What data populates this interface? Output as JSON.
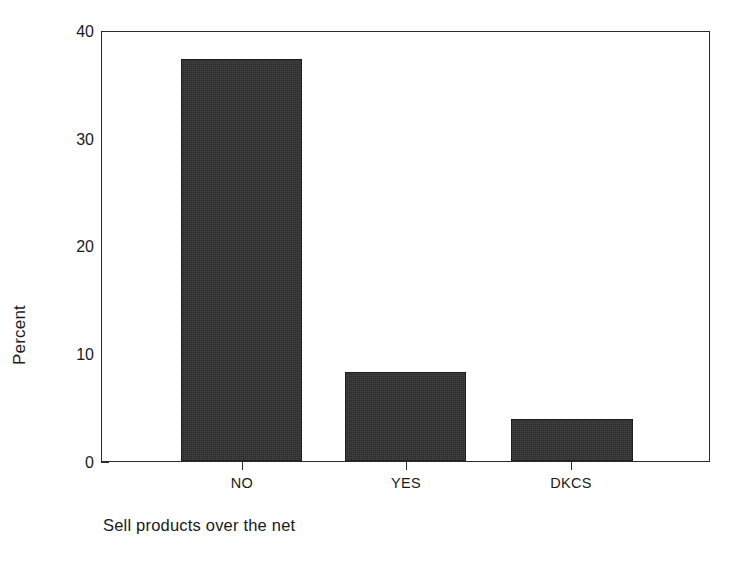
{
  "chart_data": {
    "type": "bar",
    "title": "",
    "subtitle": "",
    "xlabel": "Sell products over the net",
    "ylabel": "Percent",
    "categories": [
      "NO",
      "YES",
      "DKCS"
    ],
    "values": [
      37.5,
      8.3,
      3.9
    ],
    "ylim": [
      0,
      40
    ],
    "yticks": [
      0,
      10,
      20,
      30,
      40
    ],
    "ytick_labels": [
      "0",
      "10",
      "20",
      "30",
      "40"
    ],
    "grid": false,
    "legend": null,
    "annotations": [],
    "series": [
      {
        "name": "Percent",
        "values": [
          37.5,
          8.3,
          3.9
        ],
        "color": "#2c2c2c"
      }
    ]
  },
  "axes": {
    "y_title": "Percent",
    "x_title": "Sell products over the net",
    "y_tick_labels": [
      "40",
      "30",
      "20",
      "10",
      "0"
    ],
    "x_tick_labels": [
      "NO",
      "YES",
      "DKCS"
    ]
  },
  "style": {
    "bar_color": "#2c2c2c",
    "axis_color": "#2b2b2b",
    "text_color": "#1a1a1a",
    "background": "#ffffff"
  }
}
